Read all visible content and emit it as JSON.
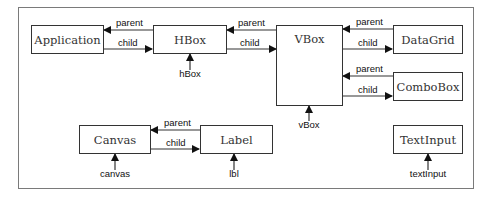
{
  "diagram": {
    "nodes": [
      {
        "id": "application",
        "label": "Application"
      },
      {
        "id": "hbox",
        "label": "HBox"
      },
      {
        "id": "vbox",
        "label": "VBox"
      },
      {
        "id": "datagrid",
        "label": "DataGrid"
      },
      {
        "id": "combobox",
        "label": "ComboBox"
      },
      {
        "id": "canvas",
        "label": "Canvas"
      },
      {
        "id": "label",
        "label": "Label"
      },
      {
        "id": "textinput",
        "label": "TextInput"
      }
    ],
    "edges": [
      {
        "from": "hbox",
        "to": "application",
        "label": "parent"
      },
      {
        "from": "application",
        "to": "hbox",
        "label": "child"
      },
      {
        "from": "vbox",
        "to": "hbox",
        "label": "parent"
      },
      {
        "from": "hbox",
        "to": "vbox",
        "label": "child"
      },
      {
        "from": "datagrid",
        "to": "vbox",
        "label": "parent"
      },
      {
        "from": "vbox",
        "to": "datagrid",
        "label": "child"
      },
      {
        "from": "combobox",
        "to": "vbox",
        "label": "parent"
      },
      {
        "from": "vbox",
        "to": "combobox",
        "label": "child"
      },
      {
        "from": "label",
        "to": "canvas",
        "label": "parent"
      },
      {
        "from": "canvas",
        "to": "label",
        "label": "child"
      }
    ],
    "references": [
      {
        "target": "hbox",
        "label": "hBox"
      },
      {
        "target": "vbox",
        "label": "vBox"
      },
      {
        "target": "canvas",
        "label": "canvas"
      },
      {
        "target": "label",
        "label": "lbl"
      },
      {
        "target": "textinput",
        "label": "textInput"
      }
    ]
  }
}
